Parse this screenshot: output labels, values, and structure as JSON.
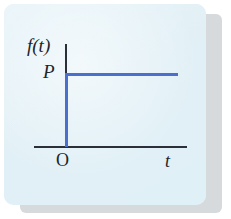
{
  "figure": {
    "kind": "unit-step-function-graph",
    "card_background": "#e4f2f7",
    "shadow_color": "#c9cdd2",
    "axis_color": "#2b2f38",
    "curve_color": "#4a6fcd",
    "labels": {
      "y_axis": "f(t)",
      "step_level": "P",
      "origin": "O",
      "x_axis": "t"
    }
  },
  "chart_data": {
    "type": "line",
    "title": "",
    "subtitle": "",
    "xlabel": "t",
    "ylabel": "f(t)",
    "grid": false,
    "legend": "none",
    "annotations": [
      {
        "text": "P",
        "role": "y-axis-value-label",
        "value": 1
      },
      {
        "text": "O",
        "role": "origin-label"
      },
      {
        "text": "t",
        "role": "x-axis-label"
      },
      {
        "text": "f(t)",
        "role": "y-axis-label"
      }
    ],
    "axis_ranges": {
      "xlim": [
        -0.35,
        1.6
      ],
      "ylim": [
        0,
        1.45
      ]
    },
    "ticks": {
      "x": [],
      "y": []
    },
    "series": [
      {
        "name": "P·u(t)",
        "color": "#4a6fcd",
        "x": [
          0,
          0,
          1.45
        ],
        "y": [
          0,
          1,
          1
        ],
        "description": "Step function: rises vertically from 0 to P at t = 0, then stays constant at P."
      }
    ]
  }
}
